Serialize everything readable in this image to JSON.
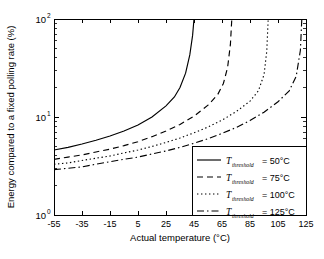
{
  "chart_data": {
    "type": "line",
    "title": "",
    "xlabel": "Actual temperature (°C)",
    "ylabel": "Energy compared to a fixed polling rate (%)",
    "xlim": [
      -55,
      125
    ],
    "ylim": [
      1,
      100
    ],
    "yscale": "log",
    "xticks": [
      "-55",
      "-35",
      "-15",
      "5",
      "25",
      "45",
      "65",
      "85",
      "105",
      "125"
    ],
    "xtick_values": [
      -55,
      -35,
      -15,
      5,
      25,
      45,
      65,
      85,
      105,
      125
    ],
    "ytick_labels": [
      "10",
      "10",
      "10"
    ],
    "ytick_exponents": [
      "0",
      "1",
      "2"
    ],
    "ytick_values": [
      1,
      10,
      100
    ],
    "grid": false,
    "legend_position": "lower right",
    "series": [
      {
        "name": "T_threshold = 50°C",
        "style": "solid",
        "x": [
          -55,
          -45,
          -35,
          -25,
          -15,
          -5,
          5,
          15,
          25,
          31,
          35,
          39,
          42,
          44,
          45
        ],
        "values": [
          4.6,
          4.9,
          5.3,
          5.8,
          6.4,
          7.2,
          8.3,
          10.0,
          13.0,
          16.0,
          20.0,
          28.0,
          43.0,
          68.0,
          100.0
        ]
      },
      {
        "name": "T_threshold = 75°C",
        "style": "dashed",
        "x": [
          -55,
          -45,
          -35,
          -25,
          -15,
          -5,
          5,
          15,
          25,
          35,
          45,
          55,
          62,
          66,
          69,
          71,
          72
        ],
        "values": [
          3.7,
          3.9,
          4.1,
          4.4,
          4.7,
          5.1,
          5.6,
          6.3,
          7.2,
          8.4,
          10.2,
          13.2,
          17.0,
          22.0,
          32.0,
          55.0,
          100.0
        ]
      },
      {
        "name": "T_threshold = 100°C",
        "style": "dotted",
        "x": [
          -55,
          -45,
          -35,
          -25,
          -15,
          -5,
          5,
          15,
          25,
          35,
          45,
          55,
          65,
          75,
          85,
          91,
          95,
          97,
          98
        ],
        "values": [
          3.3,
          3.4,
          3.6,
          3.8,
          4.0,
          4.3,
          4.6,
          5.0,
          5.5,
          6.1,
          6.9,
          7.9,
          9.3,
          11.3,
          14.5,
          18.5,
          27.0,
          47.0,
          100.0
        ]
      },
      {
        "name": "T_threshold = 125°C",
        "style": "dashdot",
        "x": [
          -55,
          -45,
          -35,
          -25,
          -15,
          -5,
          5,
          15,
          25,
          35,
          45,
          55,
          65,
          75,
          85,
          95,
          105,
          113,
          118,
          121,
          122
        ],
        "values": [
          2.9,
          3.0,
          3.1,
          3.3,
          3.5,
          3.7,
          3.9,
          4.2,
          4.5,
          4.9,
          5.4,
          6.0,
          6.8,
          7.8,
          9.2,
          11.2,
          14.3,
          18.5,
          26.0,
          48.0,
          100.0
        ]
      }
    ],
    "legend_entries": [
      {
        "symbol": "T",
        "subscript": "threshold",
        "value": "= 50°C",
        "style": "solid"
      },
      {
        "symbol": "T",
        "subscript": "threshold",
        "value": "= 75°C",
        "style": "dashed"
      },
      {
        "symbol": "T",
        "subscript": "threshold",
        "value": "= 100°C",
        "style": "dotted"
      },
      {
        "symbol": "T",
        "subscript": "threshold",
        "value": "= 125°C",
        "style": "dashdot"
      }
    ],
    "colors": {
      "line": "#000000",
      "axis": "#000000",
      "background": "#ffffff"
    }
  }
}
